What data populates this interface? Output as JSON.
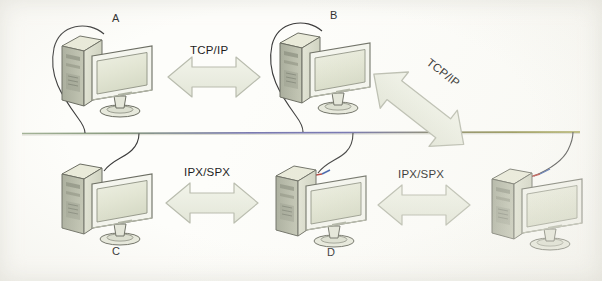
{
  "diagram": {
    "background_color": "#fdfdfa",
    "backbone": {
      "name": "network-backbone",
      "y": 133,
      "color_left": "#8fa383",
      "color_middle": "#6f6fae",
      "color_right": "#8f8f3c"
    },
    "nodes": [
      {
        "id": "A",
        "label": "A",
        "label_x": 112,
        "label_y": 12,
        "x": 58,
        "y": 30,
        "row": "top"
      },
      {
        "id": "B",
        "label": "B",
        "label_x": 330,
        "label_y": 9,
        "x": 276,
        "y": 27,
        "row": "top"
      },
      {
        "id": "C",
        "label": "C",
        "label_x": 112,
        "label_y": 245,
        "x": 58,
        "y": 158,
        "row": "bottom"
      },
      {
        "id": "D",
        "label": "D",
        "label_x": 327,
        "label_y": 246,
        "x": 272,
        "y": 160,
        "row": "bottom"
      },
      {
        "id": "E",
        "label": "",
        "label_x": 0,
        "label_y": 0,
        "x": 488,
        "y": 163,
        "row": "bottom"
      }
    ],
    "connections": [
      {
        "name": "arrow-tcp-ip-a-b",
        "protocol": "TCP/IP",
        "style": "horizontal",
        "label_x": 190,
        "label_y": 44,
        "arrow_x": 168,
        "arrow_y": 57,
        "width": 92,
        "height": 40
      },
      {
        "name": "arrow-tcp-ip-b-e",
        "protocol": "TCP/IP",
        "style": "diagonal",
        "label_x": 434,
        "label_y": 60,
        "arrow_x": 382,
        "arrow_y": 53,
        "width": 120,
        "height": 46,
        "rotation": 38
      },
      {
        "name": "arrow-ipx-spx-c-d",
        "protocol": "IPX/SPX",
        "style": "horizontal",
        "label_x": 184,
        "label_y": 166,
        "arrow_x": 166,
        "arrow_y": 183,
        "width": 92,
        "height": 40
      },
      {
        "name": "arrow-ipx-spx-d-e",
        "protocol": "IPX/SPX",
        "style": "horizontal",
        "label_x": 398,
        "label_y": 168,
        "arrow_x": 378,
        "arrow_y": 185,
        "width": 92,
        "height": 40
      }
    ],
    "palette": {
      "arrow_fill": "#eef0e6",
      "arrow_stroke": "#b9bcae",
      "tower_front": "#d9dbcb",
      "tower_side": "#b9bcab",
      "tower_top": "#e9ead9",
      "screen_fill": "#e4e7d7",
      "bezel": "#f4f5ee",
      "outline": "#6b6d62",
      "cable": "#3b3b3b",
      "cable_accent": "#b4403a",
      "text": "#262626"
    }
  }
}
